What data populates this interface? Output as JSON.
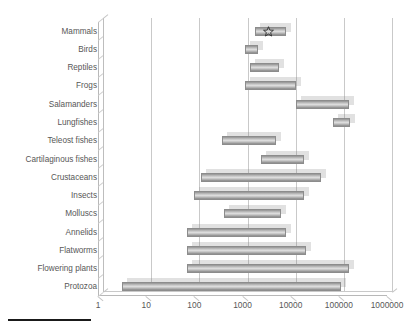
{
  "chart_data": {
    "type": "bar",
    "subtype": "horizontal-floating-range-bar",
    "title": "",
    "xlabel": "",
    "ylabel": "",
    "xscale": "log",
    "xlim": [
      1,
      1000000
    ],
    "xticks": [
      1,
      10,
      100,
      1000,
      10000,
      100000,
      1000000
    ],
    "xtick_labels": [
      "1",
      "10",
      "100",
      "1000",
      "10000",
      "100000",
      "1000000"
    ],
    "grid": "vertical-only",
    "legend": "none",
    "orientation": "horizontal",
    "categories": [
      "Mammals",
      "Birds",
      "Reptiles",
      "Frogs",
      "Salamanders",
      "Lungfishes",
      "Teleost fishes",
      "Cartilaginous fishes",
      "Crustaceans",
      "Insects",
      "Molluscs",
      "Annelids",
      "Flatworms",
      "Flowering plants",
      "Protozoa"
    ],
    "ranges": [
      {
        "category": "Mammals",
        "low": 1800,
        "high": 8100
      },
      {
        "category": "Birds",
        "low": 1100,
        "high": 2100
      },
      {
        "category": "Reptiles",
        "low": 1400,
        "high": 5700
      },
      {
        "category": "Frogs",
        "low": 1100,
        "high": 13000
      },
      {
        "category": "Salamanders",
        "low": 13000,
        "high": 160000
      },
      {
        "category": "Lungfishes",
        "low": 75000,
        "high": 170000
      },
      {
        "category": "Teleost fishes",
        "low": 380,
        "high": 5000
      },
      {
        "category": "Cartilaginous fishes",
        "low": 2400,
        "high": 19000
      },
      {
        "category": "Crustaceans",
        "low": 140,
        "high": 43000
      },
      {
        "category": "Insects",
        "low": 98,
        "high": 19000
      },
      {
        "category": "Molluscs",
        "low": 420,
        "high": 6300
      },
      {
        "category": "Annelids",
        "low": 70,
        "high": 8000
      },
      {
        "category": "Flatworms",
        "low": 70,
        "high": 21000
      },
      {
        "category": "Flowering plants",
        "low": 72,
        "high": 160000
      },
      {
        "category": "Protozoa",
        "low": 3.1,
        "high": 110000
      }
    ],
    "markers": [
      {
        "category": "Mammals",
        "x": 3400,
        "shape": "star",
        "label": ""
      }
    ],
    "colors": {
      "bar_fill_light": "#dcdcdc",
      "bar_fill_dark": "#8a8a8a",
      "bar_border": "#8c8c8c",
      "gridline": "#c9c9c9",
      "axis": "#bdbdbd",
      "text": "#575757",
      "rule": "#1a1a1a"
    }
  }
}
